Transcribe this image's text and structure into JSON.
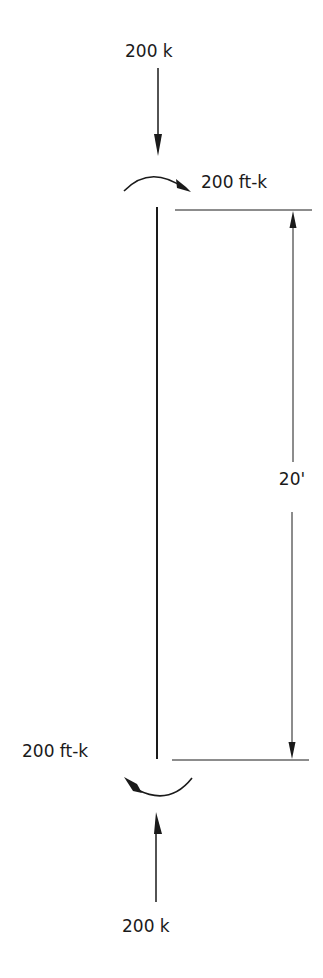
{
  "diagram": {
    "type": "column-free-body",
    "colors": {
      "ink": "#1a1a1a",
      "background": "#ffffff"
    },
    "top_load": {
      "label": "200 k",
      "direction": "down"
    },
    "top_moment": {
      "label": "200 ft-k",
      "direction": "clockwise"
    },
    "bottom_moment": {
      "label": "200 ft-k",
      "direction": "clockwise"
    },
    "bottom_load": {
      "label": "200 k",
      "direction": "up"
    },
    "dimension": {
      "label": "20'"
    }
  }
}
